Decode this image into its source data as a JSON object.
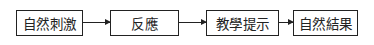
{
  "diagram": {
    "type": "flowchart",
    "direction": "left-to-right",
    "nodes": [
      {
        "id": "n1",
        "label": "自然刺激"
      },
      {
        "id": "n2",
        "label": "反應"
      },
      {
        "id": "n3",
        "label": "教學提示"
      },
      {
        "id": "n4",
        "label": "自然結果"
      }
    ],
    "edges": [
      {
        "from": "n1",
        "to": "n2"
      },
      {
        "from": "n2",
        "to": "n3"
      },
      {
        "from": "n3",
        "to": "n4"
      }
    ],
    "colors": {
      "stroke": "#222222",
      "background": "#ffffff"
    }
  }
}
